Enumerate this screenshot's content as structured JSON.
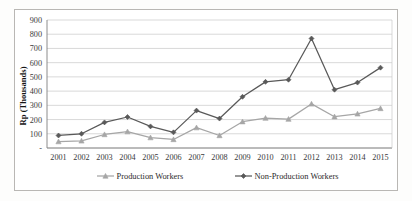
{
  "chart_data": {
    "type": "line",
    "title": "",
    "subtitle": "",
    "xlabel": "",
    "ylabel": "Rp (Thousands)",
    "categories": [
      "2001",
      "2002",
      "2003",
      "2004",
      "2005",
      "2006",
      "2007",
      "2008",
      "2009",
      "2010",
      "2011",
      "2012",
      "2013",
      "2014",
      "2015"
    ],
    "series": [
      {
        "name": "Production Workers",
        "color": "#a6a6a6",
        "marker": "triangle",
        "values": [
          45,
          50,
          95,
          115,
          73,
          60,
          143,
          88,
          185,
          210,
          203,
          310,
          220,
          240,
          278
        ]
      },
      {
        "name": "Non-Production Workers",
        "color": "#595959",
        "marker": "diamond",
        "values": [
          88,
          100,
          180,
          218,
          152,
          110,
          263,
          207,
          360,
          465,
          480,
          770,
          410,
          460,
          565
        ]
      }
    ],
    "ylim": [
      0,
      900
    ],
    "yticks": [
      0,
      100,
      200,
      300,
      400,
      500,
      600,
      700,
      800,
      900
    ],
    "ytick_labels": [
      "-",
      "100",
      "200",
      "300",
      "400",
      "500",
      "600",
      "700",
      "800",
      "900"
    ],
    "grid": true,
    "grid_axis": "y",
    "legend_position": "bottom",
    "plot_background": "#ffffff",
    "grid_color": "#c8c8c8",
    "axis_color": "#7f7f7f"
  },
  "legend": {
    "items": [
      {
        "label": "Production Workers"
      },
      {
        "label": "Non-Production Workers"
      }
    ]
  }
}
